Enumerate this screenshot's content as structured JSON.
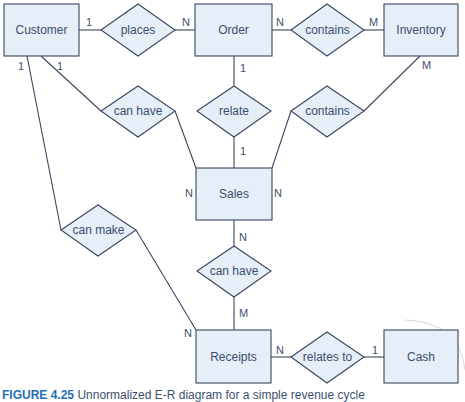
{
  "diagram": {
    "type": "E-R diagram",
    "colors": {
      "fill": "#e6eef8",
      "stroke": "#3a4660",
      "text": "#3c4f6e",
      "caption_label": "#1f6fb6"
    },
    "entities": [
      {
        "id": "customer",
        "label": "Customer"
      },
      {
        "id": "order",
        "label": "Order"
      },
      {
        "id": "inventory",
        "label": "Inventory"
      },
      {
        "id": "sales",
        "label": "Sales"
      },
      {
        "id": "receipts",
        "label": "Receipts"
      },
      {
        "id": "cash",
        "label": "Cash"
      }
    ],
    "relationships": [
      {
        "id": "places",
        "label": "places",
        "from": "Customer",
        "to": "Order",
        "cardinality": [
          "1",
          "N"
        ]
      },
      {
        "id": "contains_top",
        "label": "contains",
        "from": "Order",
        "to": "Inventory",
        "cardinality": [
          "N",
          "M"
        ]
      },
      {
        "id": "can_have_left",
        "label": "can have",
        "from": "Customer",
        "to": "Sales",
        "cardinality": [
          "1",
          "N"
        ]
      },
      {
        "id": "relate",
        "label": "relate",
        "from": "Order",
        "to": "Sales",
        "cardinality": [
          "1",
          "1"
        ]
      },
      {
        "id": "contains_right",
        "label": "contains",
        "from": "Inventory",
        "to": "Sales",
        "cardinality": [
          "M",
          "N"
        ]
      },
      {
        "id": "can_make",
        "label": "can make",
        "from": "Customer",
        "to": "Receipts",
        "cardinality": [
          "1",
          "N"
        ]
      },
      {
        "id": "can_have_mid",
        "label": "can have",
        "from": "Sales",
        "to": "Receipts",
        "cardinality": [
          "N",
          "M"
        ]
      },
      {
        "id": "relates_to",
        "label": "relates to",
        "from": "Receipts",
        "to": "Cash",
        "cardinality": [
          "N",
          "1"
        ]
      }
    ]
  },
  "caption": {
    "label": "FIGURE 4.25",
    "text": "Unnormalized E-R diagram for a simple revenue cycle"
  }
}
